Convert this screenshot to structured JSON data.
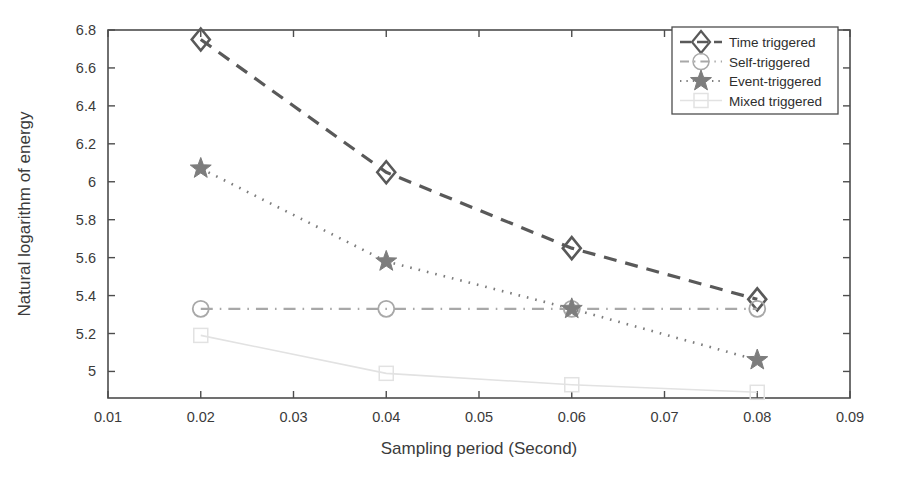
{
  "chart_data": {
    "type": "line",
    "title": "",
    "xlabel": "Sampling period (Second)",
    "ylabel": "Natural logarithm of energy",
    "xlim": [
      0.01,
      0.09
    ],
    "ylim": [
      4.86,
      6.8
    ],
    "xticks": [
      "0.01",
      "0.02",
      "0.03",
      "0.04",
      "0.05",
      "0.06",
      "0.07",
      "0.08",
      "0.09"
    ],
    "xtick_values": [
      0.01,
      0.02,
      0.03,
      0.04,
      0.05,
      0.06,
      0.07,
      0.08,
      0.09
    ],
    "yticks": [
      "5",
      "5.2",
      "5.4",
      "5.6",
      "5.8",
      "6",
      "6.2",
      "6.4",
      "6.6",
      "6.8"
    ],
    "ytick_values": [
      5,
      5.2,
      5.4,
      5.6,
      5.8,
      6,
      6.2,
      6.4,
      6.6,
      6.8
    ],
    "grid": false,
    "legend_position": "top-right",
    "x": [
      0.02,
      0.04,
      0.06,
      0.08
    ],
    "series": [
      {
        "name": "Time triggered",
        "values": [
          6.75,
          6.05,
          5.65,
          5.38
        ],
        "marker": "diamond",
        "linestyle": "dashed",
        "color": "#595959"
      },
      {
        "name": "Self-triggered",
        "values": [
          5.33,
          5.33,
          5.33,
          5.33
        ],
        "marker": "circle",
        "linestyle": "dashdot",
        "color": "#a8a8a8"
      },
      {
        "name": "Event-triggered",
        "values": [
          6.07,
          5.58,
          5.33,
          5.06
        ],
        "marker": "star",
        "linestyle": "dotted",
        "color": "#7d7d7d"
      },
      {
        "name": "Mixed triggered",
        "values": [
          5.19,
          4.99,
          4.93,
          4.89
        ],
        "marker": "square",
        "linestyle": "solid",
        "color": "#e2e2e2"
      }
    ]
  },
  "axes": {
    "xlabel": "Sampling period (Second)",
    "ylabel": "Natural logarithm of energy",
    "xticks": [
      "0.01",
      "0.02",
      "0.03",
      "0.04",
      "0.05",
      "0.06",
      "0.07",
      "0.08",
      "0.09"
    ],
    "yticks": [
      "5",
      "5.2",
      "5.4",
      "5.6",
      "5.8",
      "6",
      "6.2",
      "6.4",
      "6.6",
      "6.8"
    ]
  },
  "legend": {
    "entries": [
      {
        "label": "Time triggered"
      },
      {
        "label": "Self-triggered"
      },
      {
        "label": "Event-triggered"
      },
      {
        "label": "Mixed triggered"
      }
    ]
  },
  "colors": {
    "frame": "#4d4d4d",
    "text": "#3b3b3b",
    "time_triggered": "#595959",
    "self_triggered": "#a8a8a8",
    "event_triggered": "#7d7d7d",
    "mixed_triggered": "#e2e2e2"
  }
}
